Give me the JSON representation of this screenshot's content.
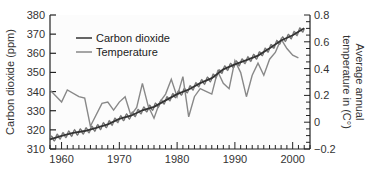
{
  "chart_data": {
    "type": "line",
    "title": "",
    "xlabel": "",
    "ylabel": "Carbon dioxide (ppm)",
    "y2label_line1": "Average annual",
    "y2label_line2": "temperature in (C°)",
    "xlim": [
      1958,
      2003
    ],
    "ylim": [
      310,
      380
    ],
    "y2lim": [
      -0.2,
      0.8
    ],
    "x_ticks": [
      "1960",
      "1970",
      "1980",
      "1990",
      "2000"
    ],
    "y_ticks": [
      "310",
      "320",
      "330",
      "340",
      "350",
      "360",
      "370",
      "380"
    ],
    "y2_ticks": [
      "−0.2",
      "0",
      "0.2",
      "0.4",
      "0.6",
      "0.8"
    ],
    "legend": {
      "position": "upper-left",
      "entries": [
        {
          "label": "Carbon dioxide",
          "color": "#333333"
        },
        {
          "label": "Temperature",
          "color": "#888888"
        }
      ]
    },
    "series": [
      {
        "name": "Carbon dioxide",
        "axis": "left",
        "color": "#333333",
        "x": [
          1958,
          1960,
          1962,
          1964,
          1966,
          1968,
          1970,
          1972,
          1974,
          1976,
          1978,
          1980,
          1982,
          1984,
          1986,
          1988,
          1990,
          1992,
          1994,
          1996,
          1998,
          2000,
          2002
        ],
        "values": [
          315,
          316.9,
          318.4,
          319.4,
          321.0,
          322.9,
          325.7,
          327.4,
          330.2,
          332.0,
          335.4,
          338.7,
          341.1,
          344.4,
          347.0,
          351.6,
          354.2,
          356.4,
          358.8,
          362.6,
          366.7,
          369.4,
          373.1
        ],
        "seasonal_amplitude_ppm": 3
      },
      {
        "name": "Temperature",
        "axis": "right",
        "color": "#888888",
        "x": [
          1958,
          1960,
          1961,
          1963,
          1964,
          1965,
          1967,
          1968,
          1969,
          1970,
          1971,
          1972,
          1973,
          1974,
          1975,
          1976,
          1977,
          1978,
          1979,
          1980,
          1981,
          1982,
          1983,
          1984,
          1985,
          1986,
          1987,
          1988,
          1989,
          1990,
          1991,
          1992,
          1993,
          1994,
          1995,
          1996,
          1997,
          1998,
          1999,
          2000,
          2001
        ],
        "values": [
          0.24,
          0.15,
          0.24,
          0.19,
          0.18,
          -0.03,
          0.14,
          0.15,
          0.09,
          0.15,
          0.19,
          0.05,
          0.11,
          0.29,
          0.12,
          0.03,
          0.15,
          0.21,
          0.32,
          0.19,
          0.34,
          0.04,
          0.19,
          0.25,
          0.23,
          0.21,
          0.38,
          0.29,
          0.25,
          0.46,
          0.37,
          0.19,
          0.35,
          0.44,
          0.35,
          0.47,
          0.52,
          0.62,
          0.55,
          0.5,
          0.48
        ]
      }
    ]
  }
}
